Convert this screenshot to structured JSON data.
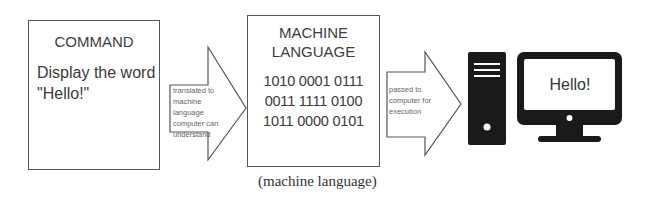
{
  "command": {
    "title": "COMMAND",
    "text_line1": "Display the word",
    "text_line2": "\"Hello!\""
  },
  "arrow1": {
    "label_line1": "translated to",
    "label_line2": "machine language",
    "label_line3": "computer can",
    "label_line4": "understand"
  },
  "machine_language": {
    "title_line1": "MACHINE",
    "title_line2": "LANGUAGE",
    "bits": [
      "1010 0001 0111",
      "0011 1111 0100",
      "1011 0000 0101"
    ]
  },
  "arrow2": {
    "label_line1": "passed to",
    "label_line2": "computer for",
    "label_line3": "execution"
  },
  "computer": {
    "tower_icon": "computer-tower-icon",
    "monitor_icon": "monitor-icon",
    "screen_text": "Hello!"
  },
  "caption": "(machine language)",
  "colors": {
    "outline": "#555555",
    "icon_fill": "#1a1a1a",
    "text": "#3a3a3a"
  }
}
